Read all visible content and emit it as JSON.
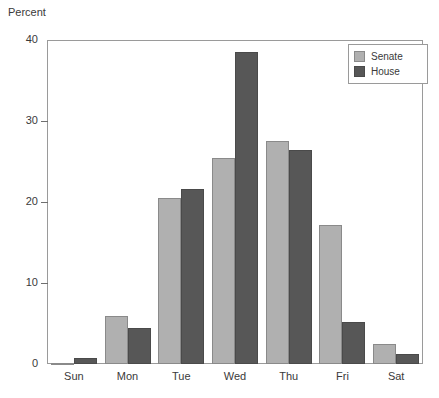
{
  "chart_data": {
    "type": "bar",
    "title": "",
    "subtitle": "",
    "xlabel": "",
    "ylabel": "Percent",
    "ylim": [
      0,
      40
    ],
    "yticks": [
      0,
      10,
      20,
      30,
      40
    ],
    "ytick_labels": [
      "0",
      "10",
      "20",
      "30",
      "40"
    ],
    "grid": false,
    "legend_position": "top-right",
    "categories": [
      "Sun",
      "Mon",
      "Tue",
      "Wed",
      "Thu",
      "Fri",
      "Sat"
    ],
    "series": [
      {
        "name": "Senate",
        "color": "#b0b0b0",
        "values": [
          0.1,
          5.9,
          20.5,
          25.4,
          27.5,
          17.2,
          2.5
        ]
      },
      {
        "name": "House",
        "color": "#575757",
        "values": [
          0.7,
          4.5,
          21.6,
          38.5,
          26.4,
          5.2,
          1.2
        ]
      }
    ]
  },
  "legend": {
    "items": [
      {
        "label": "Senate",
        "swatch": "senate-swatch"
      },
      {
        "label": "House",
        "swatch": "house-swatch"
      }
    ]
  }
}
